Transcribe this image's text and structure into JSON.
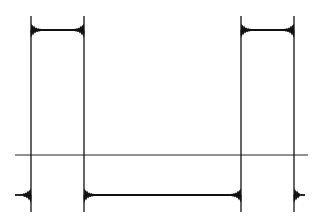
{
  "chart_data": {
    "type": "line",
    "title": "",
    "xlabel": "",
    "ylabel": "",
    "grid": false,
    "legend": null,
    "colors": {
      "trace": "#111111",
      "axis": "#222222",
      "background": "#ffffff"
    },
    "axis_line": {
      "y_px": 155,
      "x_start_px": 15,
      "x_end_px": 308
    },
    "levels": {
      "high_px": 30,
      "low_px": 195,
      "top_px": 16,
      "bottom_px": 212
    },
    "transitions_px": [
      31,
      84,
      241,
      294
    ],
    "segments": [
      {
        "state": "low",
        "x_start_px": 15,
        "x_end_px": 31
      },
      {
        "state": "high",
        "x_start_px": 31,
        "x_end_px": 84
      },
      {
        "state": "low",
        "x_start_px": 84,
        "x_end_px": 241
      },
      {
        "state": "high",
        "x_start_px": 241,
        "x_end_px": 294
      },
      {
        "state": "low",
        "x_start_px": 294,
        "x_end_px": 305
      }
    ]
  }
}
